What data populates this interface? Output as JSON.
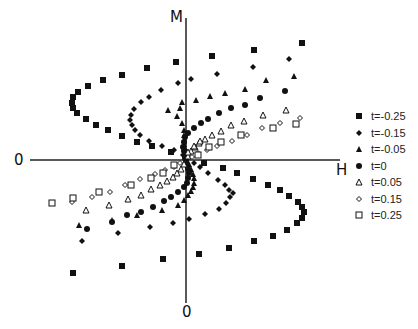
{
  "chart_data": {
    "type": "scatter",
    "title": "",
    "xlabel": "H",
    "ylabel": "M",
    "x_origin_label": "0",
    "y_origin_label": "0",
    "grid": false,
    "legend_position": "right",
    "origin_px": [
      186,
      160
    ],
    "units": "pixel offsets from origin (x right, y up)",
    "series": [
      {
        "name": "t=-0.25",
        "marker": "filled-square",
        "points": [
          [
            -10,
            98
          ],
          [
            -39,
            92
          ],
          [
            -64,
            85
          ],
          [
            -83,
            80
          ],
          [
            -98,
            74
          ],
          [
            -108,
            68
          ],
          [
            -113,
            63
          ],
          [
            -114,
            57
          ],
          [
            -113,
            52
          ],
          [
            -109,
            47
          ],
          [
            -100,
            41
          ],
          [
            -90,
            35
          ],
          [
            -78,
            30
          ],
          [
            -64,
            24
          ],
          [
            -49,
            18
          ],
          [
            -34,
            14
          ],
          [
            -15,
            8
          ],
          [
            0,
            2
          ],
          [
            26,
            104
          ],
          [
            68,
            110
          ],
          [
            116,
            117
          ],
          [
            18,
            -3
          ],
          [
            37,
            -8
          ],
          [
            51,
            -13
          ],
          [
            67,
            -19
          ],
          [
            82,
            -25
          ],
          [
            94,
            -30
          ],
          [
            103,
            -36
          ],
          [
            112,
            -42
          ],
          [
            116,
            -47
          ],
          [
            118,
            -52
          ],
          [
            116,
            -58
          ],
          [
            111,
            -63
          ],
          [
            101,
            -70
          ],
          [
            87,
            -76
          ],
          [
            68,
            -81
          ],
          [
            43,
            -88
          ],
          [
            13,
            -94
          ],
          [
            -23,
            -99
          ],
          [
            -64,
            -106
          ],
          [
            -113,
            -113
          ]
        ]
      },
      {
        "name": "t=-0.15",
        "marker": "filled-diamond",
        "points": [
          [
            -8,
            77
          ],
          [
            -25,
            70
          ],
          [
            -37,
            63
          ],
          [
            -45,
            58
          ],
          [
            -52,
            51
          ],
          [
            -55,
            45
          ],
          [
            -56,
            40
          ],
          [
            -54,
            35
          ],
          [
            -51,
            30
          ],
          [
            -46,
            25
          ],
          [
            -37,
            19
          ],
          [
            -24,
            14
          ],
          [
            -12,
            10
          ],
          [
            -3,
            5
          ],
          [
            5,
            81
          ],
          [
            31,
            86
          ],
          [
            67,
            93
          ],
          [
            103,
            101
          ],
          [
            8,
            -3
          ],
          [
            14,
            -7
          ],
          [
            22,
            -13
          ],
          [
            32,
            -20
          ],
          [
            39,
            -25
          ],
          [
            43,
            -30
          ],
          [
            47,
            -33
          ],
          [
            44,
            -37
          ],
          [
            40,
            -43
          ],
          [
            33,
            -49
          ],
          [
            19,
            -54
          ],
          [
            3,
            -59
          ],
          [
            -13,
            -63
          ],
          [
            -36,
            -67
          ],
          [
            -68,
            -73
          ],
          [
            -104,
            -81
          ]
        ]
      },
      {
        "name": "t=-0.05",
        "marker": "filled-triangle",
        "points": [
          [
            0,
            1
          ],
          [
            0,
            4
          ],
          [
            -1,
            8
          ],
          [
            -1,
            12
          ],
          [
            -2,
            16
          ],
          [
            -2,
            20
          ],
          [
            -2,
            25
          ],
          [
            -2,
            30
          ],
          [
            -4,
            37
          ],
          [
            -9,
            44
          ],
          [
            -18,
            50
          ],
          [
            -6,
            52
          ],
          [
            -4,
            58
          ],
          [
            10,
            60
          ],
          [
            24,
            64
          ],
          [
            39,
            67
          ],
          [
            59,
            71
          ],
          [
            80,
            80
          ],
          [
            108,
            84
          ],
          [
            3,
            -4
          ],
          [
            5,
            -9
          ],
          [
            7,
            -14
          ],
          [
            8,
            -18
          ],
          [
            8,
            -23
          ],
          [
            7,
            -27
          ],
          [
            5,
            -31
          ],
          [
            2,
            -35
          ],
          [
            -2,
            -40
          ],
          [
            -8,
            -45
          ],
          [
            -24,
            -50
          ],
          [
            -49,
            -55
          ],
          [
            -74,
            -60
          ],
          [
            -107,
            -65
          ]
        ]
      },
      {
        "name": "t=0",
        "marker": "filled-circle",
        "points": [
          [
            0,
            0
          ],
          [
            -1,
            5
          ],
          [
            -2,
            9
          ],
          [
            -3,
            13
          ],
          [
            -2,
            18
          ],
          [
            -1,
            23
          ],
          [
            2,
            27
          ],
          [
            8,
            32
          ],
          [
            15,
            37
          ],
          [
            22,
            41
          ],
          [
            33,
            47
          ],
          [
            45,
            52
          ],
          [
            59,
            55
          ],
          [
            74,
            62
          ],
          [
            99,
            69
          ],
          [
            1,
            -5
          ],
          [
            2,
            -9
          ],
          [
            3,
            -13
          ],
          [
            2,
            -18
          ],
          [
            1,
            -23
          ],
          [
            -2,
            -27
          ],
          [
            -8,
            -32
          ],
          [
            -15,
            -37
          ],
          [
            -22,
            -41
          ],
          [
            -33,
            -47
          ],
          [
            -45,
            -52
          ],
          [
            -59,
            -55
          ],
          [
            -74,
            -62
          ],
          [
            -99,
            -69
          ],
          [
            0,
            -3
          ],
          [
            -1,
            2
          ]
        ]
      },
      {
        "name": "t=0.05",
        "marker": "open-triangle",
        "points": [
          [
            2,
            4
          ],
          [
            5,
            9
          ],
          [
            9,
            13
          ],
          [
            13,
            17
          ],
          [
            19,
            21
          ],
          [
            26,
            25
          ],
          [
            35,
            29
          ],
          [
            45,
            35
          ],
          [
            58,
            39
          ],
          [
            77,
            45
          ],
          [
            100,
            50
          ],
          [
            2,
            8
          ],
          [
            8,
            14
          ],
          [
            14,
            19
          ],
          [
            -2,
            -4
          ],
          [
            -5,
            -9
          ],
          [
            -9,
            -13
          ],
          [
            -13,
            -17
          ],
          [
            -19,
            -21
          ],
          [
            -26,
            -25
          ],
          [
            -35,
            -29
          ],
          [
            -45,
            -35
          ],
          [
            -58,
            -39
          ],
          [
            -77,
            -45
          ],
          [
            -100,
            -50
          ]
        ]
      },
      {
        "name": "t=0.15",
        "marker": "open-diamond",
        "points": [
          [
            6,
            3
          ],
          [
            12,
            7
          ],
          [
            21,
            10
          ],
          [
            31,
            14
          ],
          [
            46,
            19
          ],
          [
            61,
            25
          ],
          [
            76,
            32
          ],
          [
            94,
            37
          ],
          [
            114,
            42
          ],
          [
            -6,
            -3
          ],
          [
            -12,
            -7
          ],
          [
            -21,
            -10
          ],
          [
            -31,
            -14
          ],
          [
            -46,
            -19
          ],
          [
            -61,
            -25
          ],
          [
            -76,
            -32
          ],
          [
            -94,
            -37
          ],
          [
            -114,
            -42
          ]
        ]
      },
      {
        "name": "t=0.25",
        "marker": "open-square",
        "points": [
          [
            12,
            5
          ],
          [
            23,
            13
          ],
          [
            35,
            18
          ],
          [
            55,
            25
          ],
          [
            87,
            32
          ],
          [
            110,
            36
          ],
          [
            -12,
            -5
          ],
          [
            -23,
            -13
          ],
          [
            -35,
            -18
          ],
          [
            -55,
            -25
          ],
          [
            -87,
            -32
          ],
          [
            -113,
            -38
          ],
          [
            -134,
            -43
          ]
        ]
      }
    ]
  },
  "axes": {
    "x_label": "H",
    "y_label": "M",
    "x_origin_label": "0",
    "y_origin_label": "0"
  },
  "legend": {
    "items": [
      {
        "label": "t=-0.25",
        "marker": "filled-square"
      },
      {
        "label": "t=-0.15",
        "marker": "filled-diamond"
      },
      {
        "label": "t=-0.05",
        "marker": "filled-triangle"
      },
      {
        "label": "t=0",
        "marker": "filled-circle"
      },
      {
        "label": "t=0.05",
        "marker": "open-triangle"
      },
      {
        "label": "t=0.15",
        "marker": "open-diamond"
      },
      {
        "label": "t=0.25",
        "marker": "open-square"
      }
    ]
  },
  "colors": {
    "ink": "#111111",
    "background": "#ffffff"
  }
}
